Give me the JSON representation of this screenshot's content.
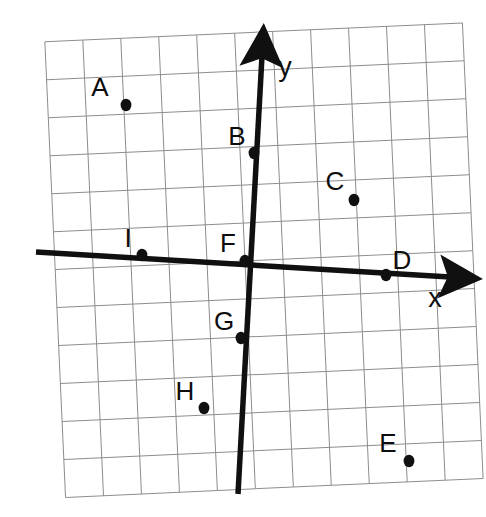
{
  "figure": {
    "kind": "coordinate-plane",
    "background_color": "#ffffff",
    "ink_color": "#101010",
    "grid_color": "#8d8d8d",
    "rotation_degrees": -2.6,
    "grid": {
      "cell_size_px": 38,
      "columns": 11,
      "rows": 12,
      "origin_cell_col": 5,
      "origin_cell_row": 6,
      "visible": true
    },
    "axes": [
      {
        "name": "x-axis",
        "label": "x",
        "label_x": 435,
        "label_y": 307,
        "arrow_tip_x": 457,
        "arrow_tip_y": 278,
        "start_x": 36,
        "start_y": 252
      },
      {
        "name": "y-axis",
        "label": "y",
        "label_x": 285,
        "label_y": 76,
        "arrow_tip_x": 263,
        "arrow_tip_y": 46,
        "end_x": 238,
        "end_y": 494
      }
    ]
  },
  "chart_data": {
    "type": "scatter",
    "title": "",
    "xlabel": "x",
    "ylabel": "y",
    "grid": true,
    "legend": "none",
    "xlim": [
      -6,
      6
    ],
    "ylim": [
      -6,
      6
    ],
    "axis_tick_labels": [],
    "origin_label": "F",
    "points": [
      {
        "label": "A",
        "x": -3,
        "y": 4,
        "px": 126,
        "py": 105,
        "label_px": 100,
        "label_py": 96
      },
      {
        "label": "B",
        "x": 0,
        "y": 3,
        "px": 254,
        "py": 153,
        "label_px": 237,
        "label_py": 145
      },
      {
        "label": "C",
        "x": 3,
        "y": 2,
        "px": 354,
        "py": 200,
        "label_px": 335,
        "label_py": 190
      },
      {
        "label": "D",
        "x": 4,
        "y": 0,
        "px": 386,
        "py": 275,
        "label_px": 402,
        "label_py": 269
      },
      {
        "label": "E",
        "x": 4,
        "y": -5,
        "px": 409,
        "py": 461,
        "label_px": 388,
        "label_py": 452
      },
      {
        "label": "F",
        "x": 0,
        "y": 0,
        "px": 245,
        "py": 261,
        "label_px": 228,
        "label_py": 252
      },
      {
        "label": "G",
        "x": 0,
        "y": -2,
        "px": 241,
        "py": 338,
        "label_px": 224,
        "label_py": 330
      },
      {
        "label": "H",
        "x": -1,
        "y": -4,
        "px": 204,
        "py": 408,
        "label_px": 185,
        "label_py": 400
      },
      {
        "label": "I",
        "x": -3,
        "y": 0,
        "px": 142,
        "py": 255,
        "label_px": 128,
        "label_py": 247
      }
    ]
  }
}
